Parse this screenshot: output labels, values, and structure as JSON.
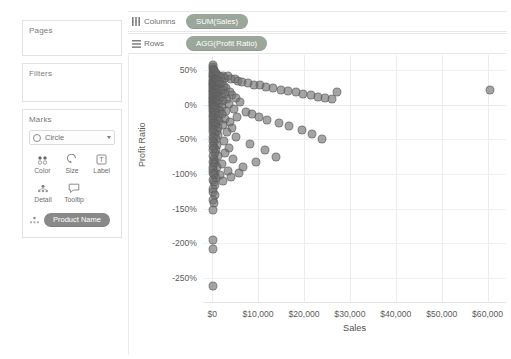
{
  "sidebar": {
    "cards": [
      {
        "title": "Pages"
      },
      {
        "title": "Filters"
      },
      {
        "title": "Marks"
      }
    ],
    "marks": {
      "type_label": "Circle",
      "buttons_row1": [
        {
          "label": "Color",
          "icon": "color-dots-icon"
        },
        {
          "label": "Size",
          "icon": "size-icon"
        },
        {
          "label": "Label",
          "icon": "label-text-icon"
        }
      ],
      "buttons_row2": [
        {
          "label": "Detail",
          "icon": "detail-icon"
        },
        {
          "label": "Tooltip",
          "icon": "tooltip-icon"
        }
      ],
      "detail_pill": "Product Name"
    }
  },
  "shelves": [
    {
      "name": "Columns",
      "icon": "columns-icon",
      "pill": "SUM(Sales)"
    },
    {
      "name": "Rows",
      "icon": "rows-icon",
      "pill": "AGG(Profit Ratio)"
    }
  ],
  "colors": {
    "mark": "#6e6e6e",
    "pill_green": "#9aa79a",
    "pill_gray": "#898989",
    "axis_text": "#5b5b5b"
  },
  "chart_data": {
    "type": "scatter",
    "title": "",
    "xlabel": "Sales",
    "ylabel": "Profit Ratio",
    "xlim": [
      -2000,
      64000
    ],
    "ylim": [
      -2.85,
      0.72
    ],
    "grid": true,
    "legend": false,
    "xtick_labels": [
      "$0",
      "$10,000",
      "$20,000",
      "$30,000",
      "$40,000",
      "$50,000",
      "$60,000"
    ],
    "xtick_values": [
      0,
      10000,
      20000,
      30000,
      40000,
      50000,
      60000
    ],
    "ytick_labels": [
      "50%",
      "0%",
      "-50%",
      "-100%",
      "-150%",
      "-200%",
      "-250%"
    ],
    "ytick_values": [
      0.5,
      0,
      -0.5,
      -1.0,
      -1.5,
      -2.0,
      -2.5
    ],
    "x_unit": "dollars",
    "y_unit": "percent_ratio",
    "series_name": "Product Name",
    "point_count": 214,
    "points": [
      [
        120,
        0.58
      ],
      [
        210,
        0.55
      ],
      [
        95,
        0.52
      ],
      [
        340,
        0.5
      ],
      [
        150,
        0.47
      ],
      [
        480,
        0.49
      ],
      [
        260,
        0.45
      ],
      [
        610,
        0.44
      ],
      [
        180,
        0.42
      ],
      [
        820,
        0.46
      ],
      [
        90,
        0.4
      ],
      [
        430,
        0.41
      ],
      [
        1150,
        0.43
      ],
      [
        300,
        0.38
      ],
      [
        710,
        0.39
      ],
      [
        1550,
        0.42
      ],
      [
        200,
        0.36
      ],
      [
        560,
        0.37
      ],
      [
        1950,
        0.4
      ],
      [
        2400,
        0.41
      ],
      [
        140,
        0.34
      ],
      [
        390,
        0.35
      ],
      [
        900,
        0.36
      ],
      [
        2900,
        0.39
      ],
      [
        3500,
        0.42
      ],
      [
        110,
        0.32
      ],
      [
        330,
        0.33
      ],
      [
        660,
        0.33
      ],
      [
        1300,
        0.34
      ],
      [
        4100,
        0.38
      ],
      [
        230,
        0.3
      ],
      [
        520,
        0.31
      ],
      [
        1050,
        0.31
      ],
      [
        2100,
        0.33
      ],
      [
        4900,
        0.37
      ],
      [
        170,
        0.28
      ],
      [
        450,
        0.29
      ],
      [
        870,
        0.29
      ],
      [
        1700,
        0.3
      ],
      [
        5700,
        0.35
      ],
      [
        130,
        0.26
      ],
      [
        360,
        0.27
      ],
      [
        740,
        0.27
      ],
      [
        1450,
        0.28
      ],
      [
        6600,
        0.33
      ],
      [
        250,
        0.24
      ],
      [
        600,
        0.25
      ],
      [
        1200,
        0.25
      ],
      [
        2600,
        0.27
      ],
      [
        7800,
        0.31
      ],
      [
        100,
        0.22
      ],
      [
        410,
        0.23
      ],
      [
        980,
        0.23
      ],
      [
        3100,
        0.25
      ],
      [
        9000,
        0.29
      ],
      [
        190,
        0.2
      ],
      [
        540,
        0.21
      ],
      [
        1100,
        0.21
      ],
      [
        2300,
        0.22
      ],
      [
        10400,
        0.28
      ],
      [
        160,
        0.18
      ],
      [
        470,
        0.19
      ],
      [
        890,
        0.19
      ],
      [
        1850,
        0.2
      ],
      [
        11800,
        0.26
      ],
      [
        280,
        0.16
      ],
      [
        640,
        0.17
      ],
      [
        1350,
        0.17
      ],
      [
        3800,
        0.19
      ],
      [
        13200,
        0.24
      ],
      [
        120,
        0.14
      ],
      [
        380,
        0.15
      ],
      [
        790,
        0.15
      ],
      [
        2800,
        0.16
      ],
      [
        14900,
        0.22
      ],
      [
        210,
        0.12
      ],
      [
        580,
        0.13
      ],
      [
        1250,
        0.13
      ],
      [
        4400,
        0.14
      ],
      [
        16500,
        0.2
      ],
      [
        140,
        0.1
      ],
      [
        440,
        0.11
      ],
      [
        950,
        0.11
      ],
      [
        2050,
        0.12
      ],
      [
        18200,
        0.18
      ],
      [
        240,
        0.08
      ],
      [
        690,
        0.09
      ],
      [
        1500,
        0.09
      ],
      [
        5200,
        0.1
      ],
      [
        19800,
        0.16
      ],
      [
        105,
        0.06
      ],
      [
        350,
        0.07
      ],
      [
        830,
        0.07
      ],
      [
        3300,
        0.08
      ],
      [
        21500,
        0.14
      ],
      [
        180,
        0.04
      ],
      [
        500,
        0.05
      ],
      [
        1150,
        0.05
      ],
      [
        2450,
        0.06
      ],
      [
        23000,
        0.12
      ],
      [
        130,
        0.02
      ],
      [
        420,
        0.03
      ],
      [
        920,
        0.03
      ],
      [
        6100,
        0.04
      ],
      [
        24500,
        0.1
      ],
      [
        220,
        0.0
      ],
      [
        610,
        0.0
      ],
      [
        1400,
        0.01
      ],
      [
        3600,
        0.01
      ],
      [
        26000,
        0.08
      ],
      [
        95,
        -0.02
      ],
      [
        330,
        -0.02
      ],
      [
        760,
        -0.03
      ],
      [
        2200,
        -0.03
      ],
      [
        27200,
        0.19
      ],
      [
        170,
        -0.05
      ],
      [
        490,
        -0.05
      ],
      [
        1080,
        -0.06
      ],
      [
        4700,
        -0.06
      ],
      [
        60500,
        0.21
      ],
      [
        250,
        -0.08
      ],
      [
        660,
        -0.08
      ],
      [
        1600,
        -0.09
      ],
      [
        3000,
        -0.09
      ],
      [
        7400,
        -0.1
      ],
      [
        115,
        -0.11
      ],
      [
        400,
        -0.12
      ],
      [
        880,
        -0.12
      ],
      [
        2050,
        -0.13
      ],
      [
        8600,
        -0.13
      ],
      [
        200,
        -0.15
      ],
      [
        550,
        -0.15
      ],
      [
        1250,
        -0.16
      ],
      [
        5500,
        -0.17
      ],
      [
        10200,
        -0.18
      ],
      [
        145,
        -0.18
      ],
      [
        460,
        -0.19
      ],
      [
        1000,
        -0.2
      ],
      [
        2700,
        -0.21
      ],
      [
        12000,
        -0.22
      ],
      [
        265,
        -0.22
      ],
      [
        700,
        -0.23
      ],
      [
        1500,
        -0.24
      ],
      [
        3900,
        -0.25
      ],
      [
        14500,
        -0.27
      ],
      [
        125,
        -0.26
      ],
      [
        370,
        -0.27
      ],
      [
        810,
        -0.28
      ],
      [
        2350,
        -0.29
      ],
      [
        16800,
        -0.31
      ],
      [
        185,
        -0.3
      ],
      [
        520,
        -0.31
      ],
      [
        1180,
        -0.33
      ],
      [
        4300,
        -0.34
      ],
      [
        19500,
        -0.36
      ],
      [
        150,
        -0.35
      ],
      [
        430,
        -0.36
      ],
      [
        960,
        -0.38
      ],
      [
        3200,
        -0.39
      ],
      [
        21800,
        -0.42
      ],
      [
        230,
        -0.4
      ],
      [
        620,
        -0.42
      ],
      [
        1350,
        -0.44
      ],
      [
        5100,
        -0.47
      ],
      [
        24000,
        -0.49
      ],
      [
        110,
        -0.46
      ],
      [
        350,
        -0.48
      ],
      [
        790,
        -0.5
      ],
      [
        2600,
        -0.53
      ],
      [
        8200,
        -0.57
      ],
      [
        175,
        -0.52
      ],
      [
        480,
        -0.55
      ],
      [
        1100,
        -0.58
      ],
      [
        3700,
        -0.62
      ],
      [
        11500,
        -0.66
      ],
      [
        140,
        -0.59
      ],
      [
        400,
        -0.62
      ],
      [
        900,
        -0.66
      ],
      [
        2900,
        -0.7
      ],
      [
        14000,
        -0.75
      ],
      [
        205,
        -0.66
      ],
      [
        540,
        -0.7
      ],
      [
        1250,
        -0.74
      ],
      [
        4600,
        -0.79
      ],
      [
        9500,
        -0.82
      ],
      [
        120,
        -0.74
      ],
      [
        330,
        -0.78
      ],
      [
        700,
        -0.82
      ],
      [
        2100,
        -0.86
      ],
      [
        6800,
        -0.9
      ],
      [
        160,
        -0.82
      ],
      [
        450,
        -0.86
      ],
      [
        1000,
        -0.9
      ],
      [
        3400,
        -0.95
      ],
      [
        5900,
        -0.98
      ],
      [
        100,
        -0.9
      ],
      [
        280,
        -0.94
      ],
      [
        620,
        -0.98
      ],
      [
        1600,
        -1.02
      ],
      [
        4200,
        -1.05
      ],
      [
        135,
        -0.98
      ],
      [
        380,
        -1.02
      ],
      [
        820,
        -1.06
      ],
      [
        2400,
        -1.1
      ],
      [
        115,
        -1.08
      ],
      [
        300,
        -1.12
      ],
      [
        680,
        -1.16
      ],
      [
        105,
        -1.22
      ],
      [
        260,
        -1.26
      ],
      [
        540,
        -1.3
      ],
      [
        190,
        -1.38
      ],
      [
        420,
        -1.42
      ],
      [
        150,
        -1.52
      ],
      [
        210,
        -1.95
      ],
      [
        230,
        -2.08
      ],
      [
        260,
        -2.62
      ]
    ],
    "outliers": [
      {
        "x": 27200,
        "y": 0.19,
        "note": "high-sales positive-ratio outlier"
      },
      {
        "x": 60500,
        "y": 0.21,
        "note": "highest-sales outlier"
      }
    ]
  }
}
